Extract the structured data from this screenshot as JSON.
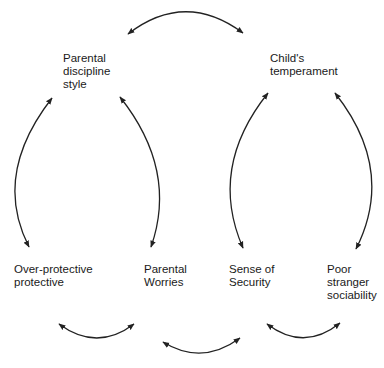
{
  "diagram": {
    "type": "relationship-cycle",
    "stroke_color": "#222222",
    "text_color": "#1a1a1a",
    "background": "#ffffff",
    "nodes": [
      {
        "id": "parental-discipline-style",
        "label": "Parental\ndiscipline\nstyle",
        "x": 63,
        "y": 52
      },
      {
        "id": "childs-temperament",
        "label": "Child's\ntemperament",
        "x": 270,
        "y": 52
      },
      {
        "id": "over-protective",
        "label": "Over-protective\nprotective",
        "x": 14,
        "y": 263
      },
      {
        "id": "parental-worries",
        "label": "Parental\nWorries",
        "x": 144,
        "y": 263
      },
      {
        "id": "sense-of-security",
        "label": "Sense of\nSecurity",
        "x": 229,
        "y": 263
      },
      {
        "id": "poor-stranger-sociability",
        "label": "Poor\nstranger\nsociability",
        "x": 327,
        "y": 263
      }
    ],
    "edges": [
      {
        "from": "parental-discipline-style",
        "to": "childs-temperament",
        "direction": "bidirectional",
        "path": "M128,34 Q185,-10 243,33"
      },
      {
        "from": "over-protective",
        "to": "parental-discipline-style",
        "direction": "bidirectional",
        "path": "M52,98 Q-8,175 29,247"
      },
      {
        "from": "parental-worries",
        "to": "parental-discipline-style",
        "direction": "bidirectional",
        "path": "M120,97 Q178,170 151,247"
      },
      {
        "from": "sense-of-security",
        "to": "childs-temperament",
        "direction": "bidirectional",
        "path": "M268,93 Q208,168 243,248"
      },
      {
        "from": "poor-stranger-sociability",
        "to": "childs-temperament",
        "direction": "bidirectional",
        "path": "M335,93 Q396,170 356,249"
      },
      {
        "from": "over-protective",
        "to": "parental-worries",
        "direction": "bidirectional",
        "path": "M59,324 Q97,352 134,324"
      },
      {
        "from": "parental-worries",
        "to": "sense-of-security",
        "direction": "bidirectional",
        "path": "M163,342 Q202,366 240,338"
      },
      {
        "from": "sense-of-security",
        "to": "poor-stranger-sociability",
        "direction": "bidirectional",
        "path": "M267,324 Q304,352 340,323"
      }
    ]
  }
}
